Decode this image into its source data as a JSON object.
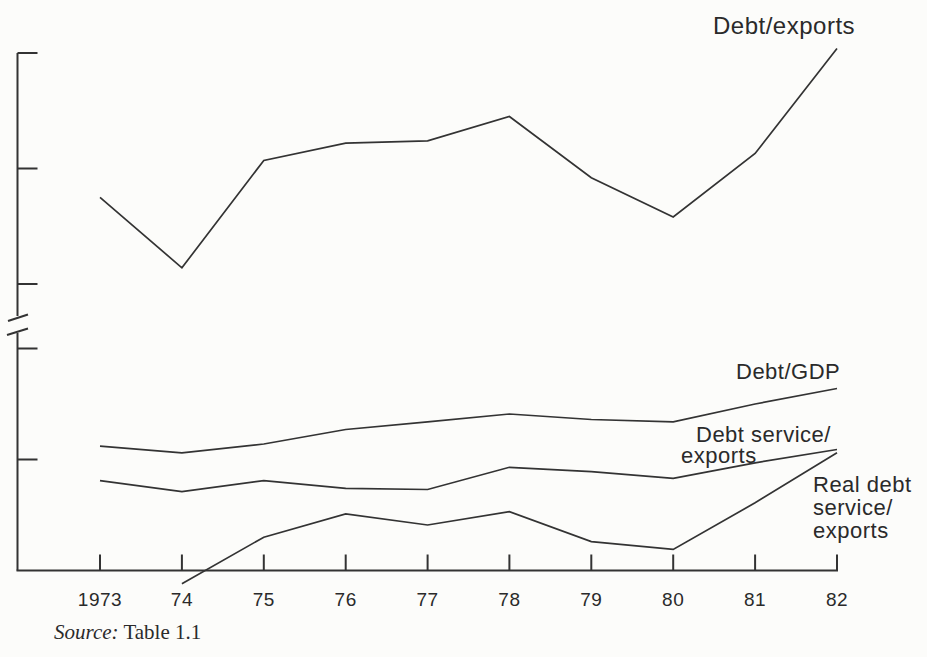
{
  "figure": {
    "background_color": "#fcfcfa",
    "line_color": "#333333",
    "text_color": "#2a2a2a"
  },
  "labels": {
    "debt_exports": "Debt/exports",
    "debt_gdp": "Debt/GDP",
    "debt_service_line1": "Debt service/",
    "debt_service_line2": "exports",
    "real_debt_service": "Real debt\nservice/\nexports"
  },
  "source": {
    "prefix": "Source:",
    "text": "Table 1.1"
  },
  "chart_data": {
    "type": "line",
    "title": "",
    "xlabel": "",
    "ylabel": "",
    "x_labels": [
      "1973",
      "74",
      "75",
      "76",
      "77",
      "78",
      "79",
      "80",
      "81",
      "82"
    ],
    "years": [
      1973,
      1974,
      1975,
      1976,
      1977,
      1978,
      1979,
      1980,
      1981,
      1982
    ],
    "y_axis": {
      "tick_labels": "none (unlabeled tick marks)",
      "tick_values_units": [
        1,
        2,
        3,
        4,
        5
      ],
      "axis_break": true,
      "axis_break_between_units": [
        2,
        3
      ],
      "note": "Y axis has no printed numbers; series values below are expressed in tick-interval units above the x-axis, estimated from the unlabeled ticks."
    },
    "grid": false,
    "legend": "inline labels next to lines",
    "series": [
      {
        "name": "Debt/exports",
        "values": [
          3.75,
          3.14,
          4.07,
          4.22,
          4.24,
          4.45,
          3.92,
          3.58,
          4.13,
          5.04
        ]
      },
      {
        "name": "Debt/GDP",
        "values": [
          1.12,
          1.06,
          1.14,
          1.27,
          1.34,
          1.41,
          1.36,
          1.34,
          1.5,
          1.64
        ]
      },
      {
        "name": "Debt service/exports",
        "values": [
          0.81,
          0.71,
          0.81,
          0.74,
          0.73,
          0.93,
          0.89,
          0.83,
          0.97,
          1.09
        ]
      },
      {
        "name": "Real debt service/exports",
        "values": [
          null,
          -0.12,
          0.3,
          0.51,
          0.41,
          0.53,
          0.26,
          0.19,
          0.61,
          1.06
        ]
      }
    ]
  }
}
